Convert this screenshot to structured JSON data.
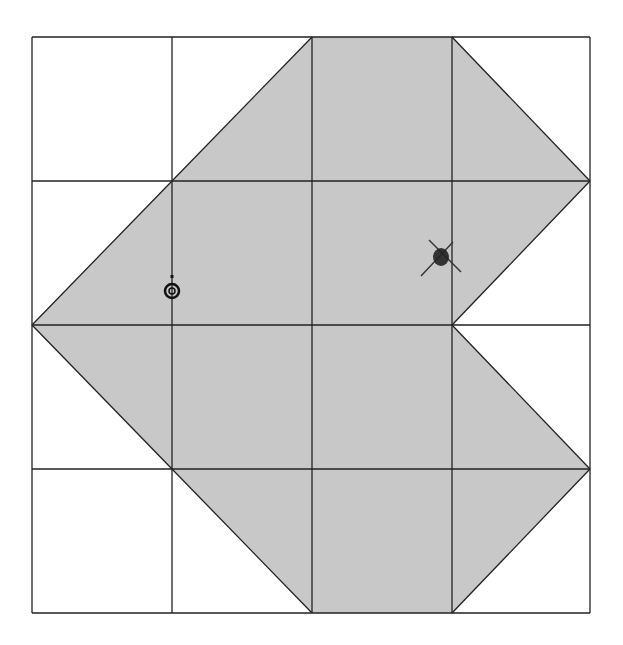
{
  "diagram": {
    "type": "grid-shape",
    "grid": {
      "columns": 4,
      "rows": 4,
      "x_lines": [
        32,
        172,
        312,
        452,
        590
      ],
      "y_lines": [
        37,
        181,
        325,
        469,
        613
      ],
      "line_color": "#222222"
    },
    "shape": {
      "fill": "#c8c8c8",
      "stroke": "#222222",
      "points": [
        [
          312,
          37
        ],
        [
          452,
          37
        ],
        [
          590,
          181
        ],
        [
          452,
          325
        ],
        [
          590,
          469
        ],
        [
          452,
          613
        ],
        [
          312,
          613
        ],
        [
          172,
          469
        ],
        [
          32,
          325
        ],
        [
          172,
          181
        ]
      ]
    },
    "marks": [
      {
        "name": "circle-mark",
        "x": 172,
        "y": 291,
        "label": ""
      },
      {
        "name": "x-mark",
        "x": 441,
        "y": 256,
        "label": ""
      }
    ],
    "colors": {
      "background": "#ffffff",
      "fill": "#c8c8c8",
      "ink": "#111111"
    }
  }
}
